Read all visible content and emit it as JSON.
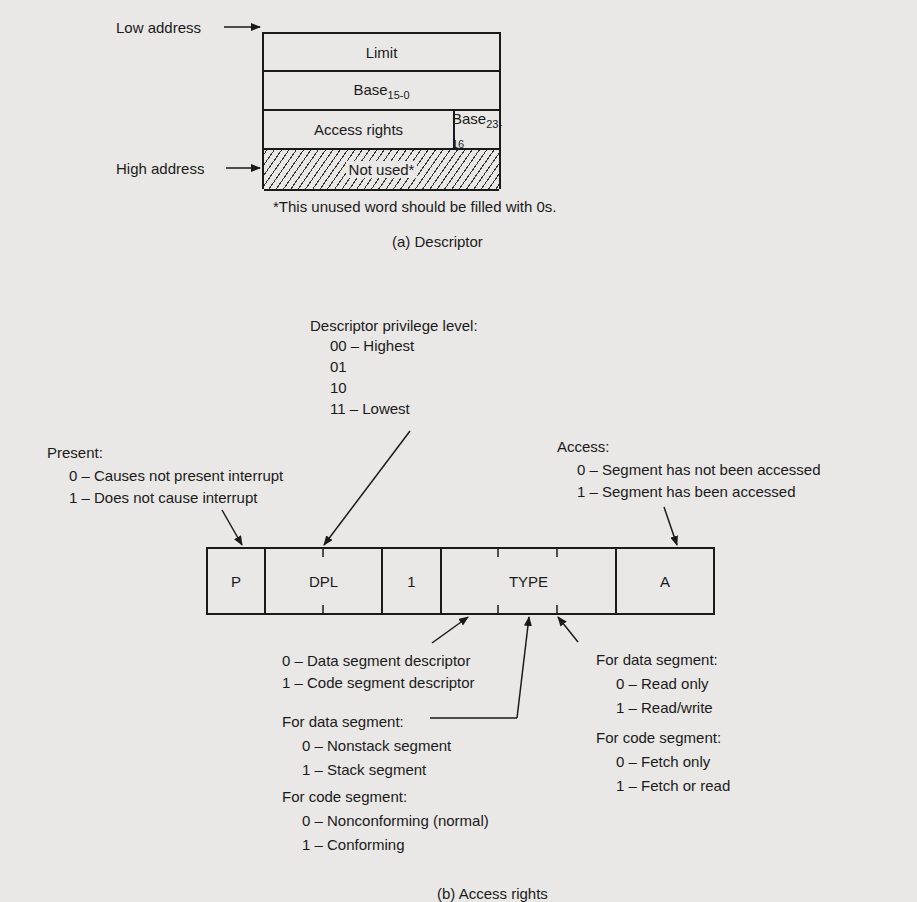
{
  "descriptor": {
    "low_address_label": "Low address",
    "high_address_label": "High address",
    "rows": {
      "limit": "Limit",
      "base_low": "Base",
      "base_low_sub": "15-0",
      "access_rights": "Access rights",
      "base_high": "Base",
      "base_high_sub": "23-16",
      "not_used": "Not used*"
    },
    "footnote": "*This unused word should be filled with 0s.",
    "caption": "(a)  Descriptor"
  },
  "access_rights": {
    "dpl": {
      "title": "Descriptor privilege level:",
      "items": [
        "00 – Highest",
        "01",
        "10",
        "11 – Lowest"
      ]
    },
    "present": {
      "title": "Present:",
      "items": [
        "0 – Causes not present interrupt",
        "1 – Does not cause interrupt"
      ]
    },
    "access": {
      "title": "Access:",
      "items": [
        "0 – Segment has not been accessed",
        "1 – Segment has been accessed"
      ]
    },
    "fields": [
      "P",
      "DPL",
      "1",
      "TYPE",
      "A"
    ],
    "type_bit1": {
      "items": [
        "0 – Data segment descriptor",
        "1 – Code segment descriptor"
      ]
    },
    "type_bit2": {
      "data_title": "For data segment:",
      "data_items": [
        "0 – Nonstack segment",
        "1 – Stack segment"
      ],
      "code_title": "For code segment:",
      "code_items": [
        "0 – Nonconforming (normal)",
        "1 – Conforming"
      ]
    },
    "type_bit3": {
      "data_title": "For data segment:",
      "data_items": [
        "0 – Read only",
        "1 – Read/write"
      ],
      "code_title": "For code segment:",
      "code_items": [
        "0 – Fetch only",
        "1 – Fetch or read"
      ]
    },
    "caption": "(b)  Access rights"
  }
}
